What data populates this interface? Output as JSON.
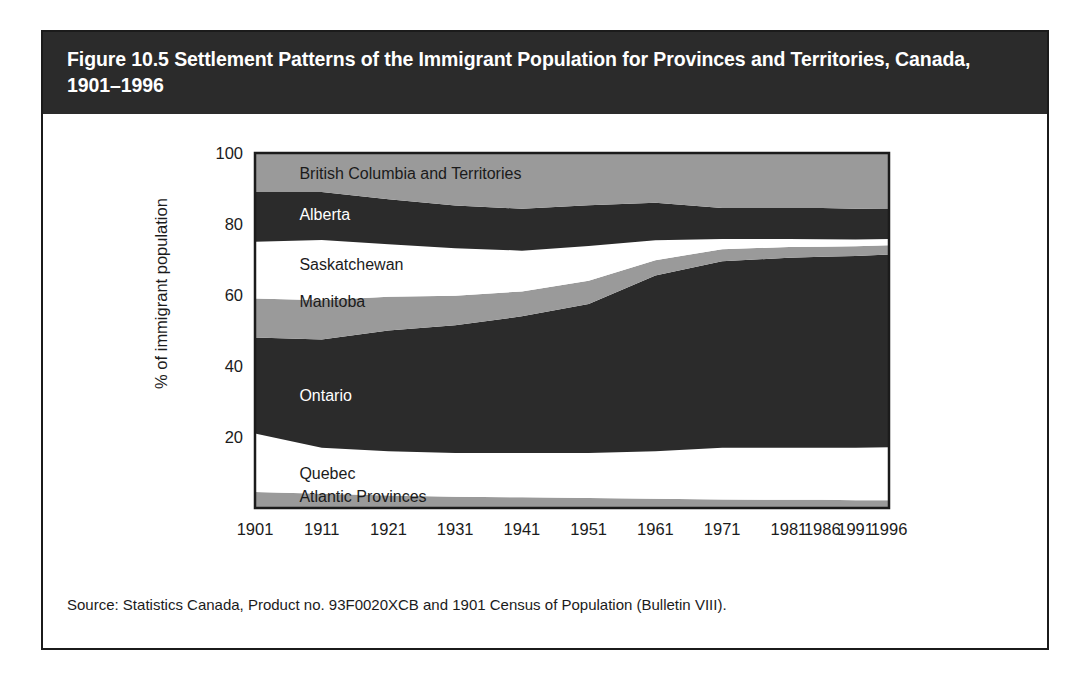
{
  "figure": {
    "title": "Figure 10.5 Settlement Patterns of the Immigrant Population for Provinces and Territories, Canada, 1901–1996",
    "source": "Source: Statistics Canada, Product no. 93F0020XCB and 1901 Census of Population (Bulletin VIII)."
  },
  "colors": {
    "dark": "#2b2b2b",
    "gray": "#9a9a9a",
    "white": "#ffffff",
    "frame": "#1b1b1b",
    "banner_bg": "#2b2b2b",
    "banner_text": "#ffffff"
  },
  "chart_data": {
    "type": "area",
    "title": "Figure 10.5 Settlement Patterns of the Immigrant Population for Provinces and Territories, Canada, 1901–1996",
    "xlabel": "",
    "ylabel": "% of immigrant population",
    "x": [
      1901,
      1911,
      1921,
      1931,
      1941,
      1951,
      1961,
      1971,
      1981,
      1986,
      1991,
      1996
    ],
    "xtick_labels": [
      "1901",
      "1911",
      "1921",
      "1931",
      "1941",
      "1951",
      "1961",
      "1971",
      "1981",
      "1986",
      "1991",
      "1996"
    ],
    "ytick_labels": [
      "20",
      "40",
      "60",
      "80",
      "100"
    ],
    "yticks": [
      20,
      40,
      60,
      80,
      100
    ],
    "ylim": [
      0,
      100
    ],
    "grid": false,
    "legend": "inline-labels",
    "stacked": true,
    "stack_order_bottom_to_top": [
      "Atlantic Provinces",
      "Quebec",
      "Ontario",
      "Manitoba",
      "Saskatchewan",
      "Alberta",
      "British Columbia and Territories"
    ],
    "series": [
      {
        "name": "Atlantic Provinces",
        "fill": "#9a9a9a",
        "label_color": "#1b1b1b",
        "values": [
          4.5,
          4.0,
          3.5,
          3.2,
          3.0,
          2.8,
          2.6,
          2.4,
          2.3,
          2.3,
          2.2,
          2.2
        ]
      },
      {
        "name": "Quebec",
        "fill": "#ffffff",
        "label_color": "#1b1b1b",
        "values": [
          16.5,
          13.0,
          12.5,
          12.3,
          12.5,
          12.7,
          13.4,
          14.6,
          14.7,
          14.7,
          14.8,
          14.9
        ]
      },
      {
        "name": "Ontario",
        "fill": "#2b2b2b",
        "label_color": "#ffffff",
        "values": [
          27.0,
          30.5,
          34.0,
          36.0,
          38.5,
          42.0,
          49.5,
          52.5,
          53.5,
          53.8,
          54.0,
          54.3
        ]
      },
      {
        "name": "Manitoba",
        "fill": "#9a9a9a",
        "label_color": "#1b1b1b",
        "values": [
          11.0,
          11.0,
          9.5,
          8.3,
          7.0,
          6.5,
          4.3,
          3.4,
          3.0,
          2.8,
          2.7,
          2.6
        ]
      },
      {
        "name": "Saskatchewan",
        "fill": "#ffffff",
        "label_color": "#1b1b1b",
        "values": [
          16.0,
          17.0,
          14.8,
          13.4,
          11.5,
          9.8,
          5.6,
          2.9,
          2.3,
          2.1,
          1.9,
          1.8
        ]
      },
      {
        "name": "Alberta",
        "fill": "#2b2b2b",
        "label_color": "#ffffff",
        "values": [
          14.0,
          13.5,
          12.7,
          12.0,
          11.8,
          11.5,
          10.6,
          8.7,
          8.7,
          8.8,
          8.7,
          8.6
        ]
      },
      {
        "name": "British Columbia and Territories",
        "fill": "#9a9a9a",
        "label_color": "#1b1b1b",
        "values": [
          11.0,
          11.0,
          13.0,
          14.8,
          15.7,
          14.7,
          14.0,
          15.5,
          15.5,
          15.5,
          15.7,
          15.6
        ]
      }
    ],
    "inline_labels": [
      {
        "text": "British Columbia and Territories",
        "x_pct": 7.0,
        "y_pct": 94.0,
        "color": "#1b1b1b"
      },
      {
        "text": "Alberta",
        "x_pct": 7.0,
        "y_pct": 82.5,
        "color": "#ffffff"
      },
      {
        "text": "Saskatchewan",
        "x_pct": 7.0,
        "y_pct": 68.5,
        "color": "#1b1b1b"
      },
      {
        "text": "Manitoba",
        "x_pct": 7.0,
        "y_pct": 58.0,
        "color": "#1b1b1b"
      },
      {
        "text": "Ontario",
        "x_pct": 7.0,
        "y_pct": 31.5,
        "color": "#ffffff"
      },
      {
        "text": "Quebec",
        "x_pct": 7.0,
        "y_pct": 9.5,
        "color": "#1b1b1b"
      },
      {
        "text": "Atlantic Provinces",
        "x_pct": 7.0,
        "y_pct": 3.2,
        "color": "#1b1b1b"
      }
    ]
  }
}
